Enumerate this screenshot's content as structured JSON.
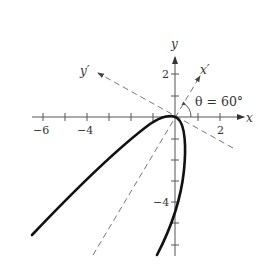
{
  "figure": {
    "type": "rotated-axes-parabola",
    "axes": {
      "x_label": "x",
      "y_label": "y",
      "x_prime_label": "x′",
      "y_prime_label": "y′",
      "x_tick_labels": [
        "−6",
        "−4",
        "2"
      ],
      "y_tick_labels": [
        "2",
        "−4"
      ]
    },
    "angle_annotation": "θ = 60°",
    "colors": {
      "axis": "#555555",
      "curve": "#111111",
      "dashed": "#666666",
      "text": "#333333"
    }
  }
}
